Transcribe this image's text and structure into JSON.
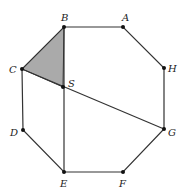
{
  "diagram": {
    "type": "geometry",
    "shape": "regular-octagon",
    "colors": {
      "stroke": "#333333",
      "shade": "#aaaaaa",
      "point": "#111111"
    },
    "vertices": [
      {
        "label": "A",
        "x": 123,
        "y": 27,
        "lx": 122,
        "ly": 21
      },
      {
        "label": "B",
        "x": 64,
        "y": 27,
        "lx": 61,
        "ly": 21
      },
      {
        "label": "C",
        "x": 22,
        "y": 69,
        "lx": 9,
        "ly": 73
      },
      {
        "label": "D",
        "x": 23,
        "y": 130,
        "lx": 10,
        "ly": 136
      },
      {
        "label": "E",
        "x": 64,
        "y": 172,
        "lx": 60,
        "ly": 187
      },
      {
        "label": "F",
        "x": 123,
        "y": 172,
        "lx": 119,
        "ly": 187
      },
      {
        "label": "G",
        "x": 164,
        "y": 129,
        "lx": 168,
        "ly": 136
      },
      {
        "label": "H",
        "x": 164,
        "y": 68,
        "lx": 168,
        "ly": 72
      }
    ],
    "interior_point": {
      "label": "S",
      "x": 63,
      "y": 87,
      "lx": 68,
      "ly": 87
    },
    "segments": [
      {
        "from": "C",
        "to": "G"
      },
      {
        "from": "B",
        "to": "E"
      }
    ],
    "shaded_triangle": [
      "B",
      "C",
      "S"
    ]
  }
}
